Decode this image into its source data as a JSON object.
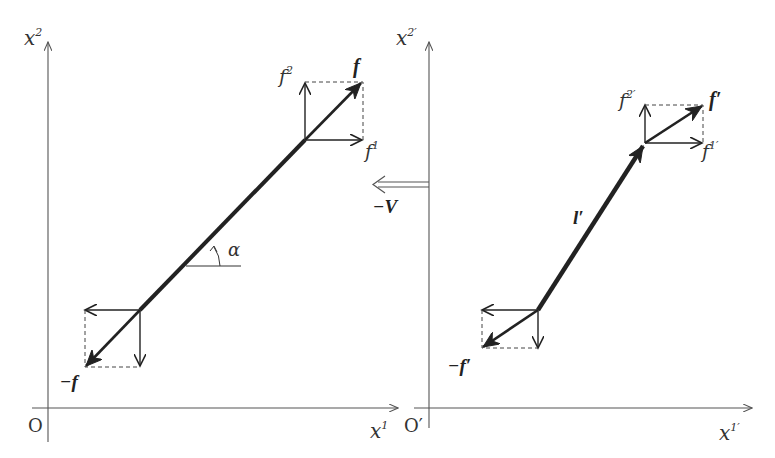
{
  "figure": {
    "left_frame": {
      "axis_vertical_label": {
        "base": "x",
        "sup": "2"
      },
      "axis_horizontal_label": {
        "base": "x",
        "sup": "1"
      },
      "origin_label": "O",
      "force_label": "f",
      "force_component_1": {
        "base": "f",
        "sup": "1"
      },
      "force_component_2": {
        "base": "f",
        "sup": "2"
      },
      "negative_force_label": "−f",
      "angle_label": "α"
    },
    "velocity_arrow": {
      "label": "−V",
      "style": "double-line arrow pointing left"
    },
    "right_frame": {
      "axis_vertical_label": {
        "base": "x",
        "sup": "2′"
      },
      "axis_horizontal_label": {
        "base": "x",
        "sup": "1′"
      },
      "origin_label": "O′",
      "force_label": "f′",
      "force_component_1": {
        "base": "f",
        "sup": "1′"
      },
      "force_component_2": {
        "base": "f",
        "sup": "2′"
      },
      "negative_force_label": "−f′",
      "rod_label": "l′"
    },
    "colors": {
      "axis": "#555555",
      "vector": "#222222",
      "dashed": "#444444",
      "background": "#ffffff"
    }
  }
}
